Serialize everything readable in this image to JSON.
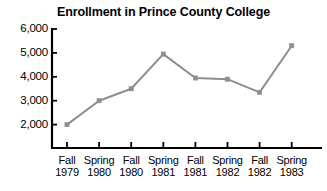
{
  "chart_data": {
    "type": "line",
    "title": "Enrollment in Prince County College",
    "xlabel": "",
    "ylabel": "",
    "categories": [
      "Fall 1979",
      "Spring 1980",
      "Fall 1980",
      "Spring 1981",
      "Fall 1981",
      "Spring 1982",
      "Fall 1982",
      "Spring 1983"
    ],
    "category_lines": [
      [
        "Fall",
        "1979"
      ],
      [
        "Spring",
        "1980"
      ],
      [
        "Fall",
        "1980"
      ],
      [
        "Spring",
        "1981"
      ],
      [
        "Fall",
        "1981"
      ],
      [
        "Spring",
        "1982"
      ],
      [
        "Fall",
        "1982"
      ],
      [
        "Spring",
        "1983"
      ]
    ],
    "values": [
      2000,
      3000,
      3500,
      4950,
      3950,
      3900,
      3350,
      5300
    ],
    "ylim": [
      1500,
      6000
    ],
    "yticks": [
      2000,
      3000,
      4000,
      5000,
      6000
    ],
    "ytick_labels": [
      "2,000",
      "3,000",
      "4,000",
      "5,000",
      "6,000"
    ],
    "grid": false,
    "legend": null,
    "series_color": "#8e8e8e",
    "marker": "square",
    "axis_color": "#000000"
  },
  "colors": {
    "background": "#ffffff",
    "text": "#000000",
    "line": "#8e8e8e",
    "axis": "#000000"
  }
}
